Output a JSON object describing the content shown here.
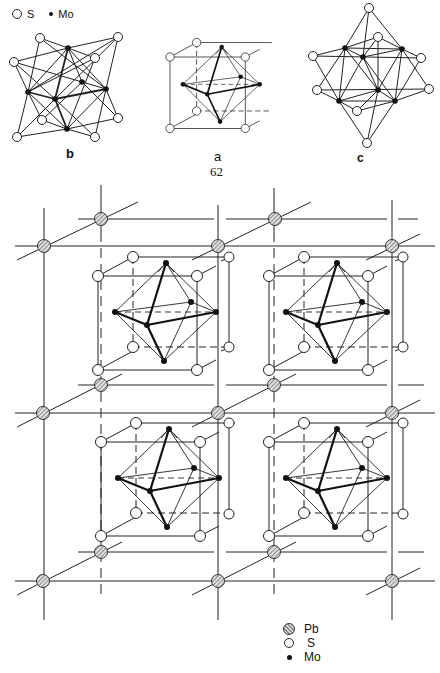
{
  "figure": {
    "top_legend": {
      "s_label": "S",
      "mo_label": "Mo"
    },
    "panels": [
      {
        "id": "b",
        "label": "b",
        "description": "Mo6S8 cluster viewed along 3-fold axis"
      },
      {
        "id": "a",
        "label": "a",
        "description": "Mo6 octahedron inside S8 cube"
      },
      {
        "id": "c",
        "label": "c",
        "description": "Mo6S8 cluster, alternate view"
      }
    ],
    "page_number": "62",
    "bottom_legend": [
      {
        "symbol": "hatched-circle",
        "label": "Pb"
      },
      {
        "symbol": "open-circle",
        "label": "S"
      },
      {
        "symbol": "filled-dot",
        "label": "Mo"
      }
    ],
    "colors": {
      "line": "#222222",
      "pb_fill": "#9a9a9a",
      "background": "#ffffff"
    }
  }
}
